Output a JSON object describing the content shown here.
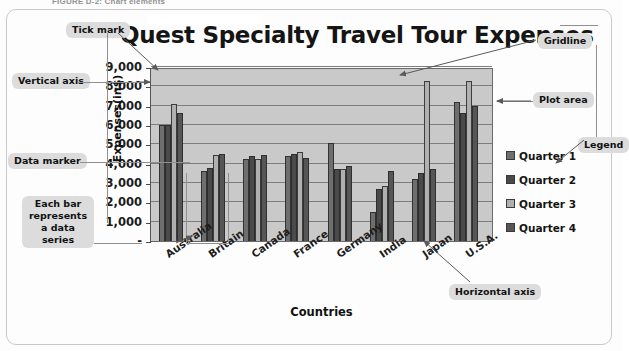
{
  "figure": {
    "caption": "FIGURE D-2: Chart elements"
  },
  "chart": {
    "title": "Quest Specialty Travel Tour Expenses",
    "y_axis_title": "Expenses(in$)",
    "x_axis_title": "Countries"
  },
  "legend": {
    "items": [
      {
        "label": "Quarter 1",
        "color": "#6e6e6e"
      },
      {
        "label": "Quarter 2",
        "color": "#4a4a4a"
      },
      {
        "label": "Quarter 3",
        "color": "#b0b0b0"
      },
      {
        "label": "Quarter 4",
        "color": "#565656"
      }
    ]
  },
  "callouts": {
    "tick_mark": "Tick mark",
    "vertical_axis": "Vertical axis",
    "data_marker": "Data marker",
    "data_series": "Each bar represents a data series",
    "gridline": "Gridline",
    "plot_area": "Plot area",
    "legend": "Legend",
    "horizontal_axis": "Horizontal axis"
  },
  "chart_data": {
    "type": "bar",
    "title": "Quest Specialty Travel Tour Expenses",
    "xlabel": "Countries",
    "ylabel": "Expenses(in$)",
    "ylim": [
      0,
      9000
    ],
    "yticks": [
      "-",
      "1,000",
      "2,000",
      "3,000",
      "4,000",
      "5,000",
      "6,000",
      "7,000",
      "8,000",
      "9,000"
    ],
    "grid": true,
    "legend_position": "right",
    "categories": [
      "Australia",
      "Britain",
      "Canada",
      "France",
      "Germany",
      "India",
      "Japan",
      "U.S.A."
    ],
    "series": [
      {
        "name": "Quarter 1",
        "color": "#6e6e6e",
        "values": [
          6000,
          3600,
          4250,
          4400,
          5050,
          1500,
          3200,
          7200
        ]
      },
      {
        "name": "Quarter 2",
        "color": "#4a4a4a",
        "values": [
          6000,
          3800,
          4400,
          4500,
          3750,
          2700,
          3500,
          6600
        ]
      },
      {
        "name": "Quarter 3",
        "color": "#b0b0b0",
        "values": [
          7100,
          4450,
          4250,
          4600,
          3700,
          2850,
          8300,
          8300
        ]
      },
      {
        "name": "Quarter 4",
        "color": "#565656",
        "values": [
          6600,
          4500,
          4450,
          4300,
          3900,
          3600,
          3700,
          7000
        ]
      }
    ]
  }
}
